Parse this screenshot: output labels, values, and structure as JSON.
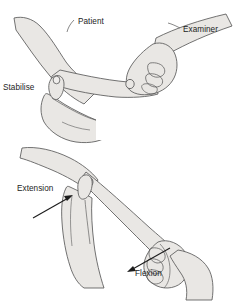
{
  "figure": {
    "background_color": "#ffffff",
    "skin_fill": "#e9e7e4",
    "skin_fill_shadow": "#dcdad6",
    "outline_color": "#5a5a5a",
    "label_color": "#1c1c1c",
    "arrow_color": "#1c1c1c"
  },
  "panels": [
    {
      "id": "panel-top",
      "name": "stabilise-and-grip-panel",
      "labels": [
        {
          "id": "label-patient",
          "text": "Patient",
          "x": 78,
          "y": 24
        },
        {
          "id": "label-examiner",
          "text": "Examiner",
          "x": 183,
          "y": 32
        },
        {
          "id": "label-stabilise",
          "text": "Stabilise",
          "x": 3,
          "y": 90
        }
      ],
      "arrows": []
    },
    {
      "id": "panel-bottom",
      "name": "flexion-extension-panel",
      "labels": [
        {
          "id": "label-extension",
          "text": "Extension",
          "x": 17,
          "y": 191
        },
        {
          "id": "label-flexion",
          "text": "Flexion",
          "x": 135,
          "y": 276
        }
      ],
      "arrows": [
        {
          "id": "arrow-extension",
          "points": "33,218 72,196",
          "head_at": "72,196",
          "direction": "up-right"
        },
        {
          "id": "arrow-flexion",
          "points": "170,248 128,272",
          "head_at": "128,272",
          "direction": "down-left"
        }
      ]
    }
  ]
}
